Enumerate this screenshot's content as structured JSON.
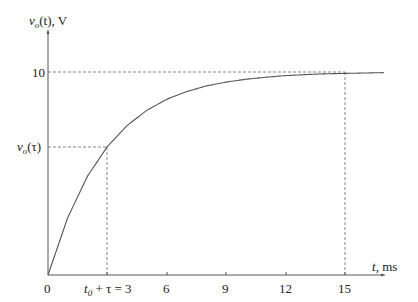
{
  "chart_data": {
    "type": "line",
    "title": "",
    "xlabel": "t, ms",
    "ylabel": "v_o(t), V",
    "xlim": [
      0,
      17
    ],
    "ylim": [
      0,
      10.5
    ],
    "x_ticks": [
      "0",
      "t_0 + τ = 3",
      "6",
      "9",
      "12",
      "15"
    ],
    "x_tick_values": [
      0,
      3,
      6,
      9,
      12,
      15
    ],
    "y_ticks": [
      "10",
      "v_o(τ)"
    ],
    "y_tick_values": [
      10,
      6.32
    ],
    "grid": false,
    "legend": null,
    "series": [
      {
        "name": "v_o(t) = 10(1 - e^{-t/3})",
        "x": [
          0,
          1,
          2,
          3,
          4,
          5,
          6,
          7,
          8,
          9,
          10,
          11,
          12,
          13,
          14,
          15,
          16,
          17
        ],
        "values": [
          0,
          2.83,
          4.87,
          6.32,
          7.36,
          8.11,
          8.65,
          9.03,
          9.31,
          9.5,
          9.64,
          9.74,
          9.82,
          9.87,
          9.91,
          9.93,
          9.95,
          9.97
        ]
      }
    ],
    "annotations": [
      {
        "type": "dashed-hline",
        "y": 10,
        "x_to": 15
      },
      {
        "type": "dashed-vline",
        "x": 15,
        "y_to": 10
      },
      {
        "type": "dashed-hline",
        "y": 6.32,
        "x_to": 3,
        "label": "v_o(τ)"
      },
      {
        "type": "dashed-vline",
        "x": 3,
        "y_to": 6.32,
        "label": "t_0 + τ = 3"
      }
    ]
  },
  "labels": {
    "y_axis_v": "v",
    "y_axis_sub": "o",
    "y_axis_rest": "(t), V",
    "y_tick_10": "10",
    "y_tick_tau_v": "v",
    "y_tick_tau_sub": "o",
    "y_tick_tau_rest": "(τ)",
    "x_tick_0": "0",
    "x_tick_t": "t",
    "x_tick_t_sub": "0",
    "x_tick_tau_rest": " + τ = 3",
    "x_tick_6": "6",
    "x_tick_9": "9",
    "x_tick_12": "12",
    "x_tick_15": "15",
    "x_axis_t": "t",
    "x_axis_rest": ", ms"
  }
}
